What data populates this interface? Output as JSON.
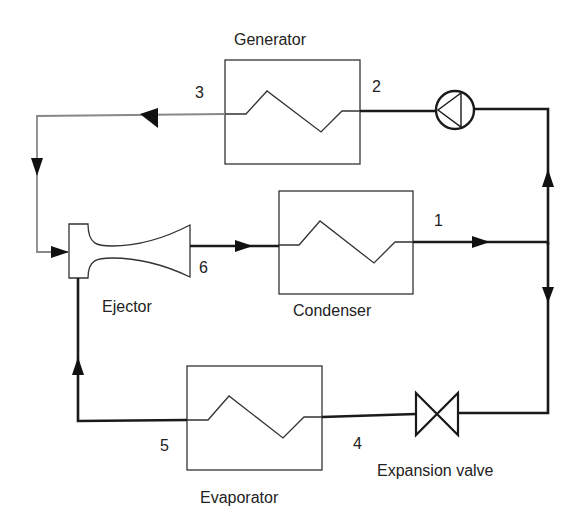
{
  "diagram": {
    "components": {
      "generator": {
        "label": "Generator"
      },
      "condenser": {
        "label": "Condenser"
      },
      "evaporator": {
        "label": "Evaporator"
      },
      "ejector": {
        "label": "Ejector"
      },
      "expansion_valve": {
        "label": "Expansion valve"
      },
      "pump": {
        "label": ""
      }
    },
    "state_points": {
      "p1": "1",
      "p2": "2",
      "p3": "3",
      "p4": "4",
      "p5": "5",
      "p6": "6"
    },
    "colors": {
      "primary_line": "#1a1a1a",
      "motive_line": "#888888",
      "component_outline": "#333333",
      "background": "#ffffff"
    }
  }
}
